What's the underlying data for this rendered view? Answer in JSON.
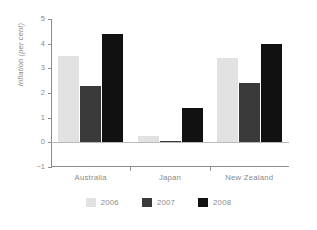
{
  "chart_data": {
    "type": "bar",
    "title": "",
    "subtitle": "",
    "xlabel": "",
    "ylabel": "Inflation (per cent)",
    "categories": [
      "Australia",
      "Japan",
      "New Zealand"
    ],
    "series": [
      {
        "name": "2006",
        "color": "#e2e2e2",
        "values": [
          3.5,
          0.25,
          3.4
        ]
      },
      {
        "name": "2007",
        "color": "#3a3a3a",
        "values": [
          2.3,
          0.06,
          2.4
        ]
      },
      {
        "name": "2008",
        "color": "#111111",
        "values": [
          4.4,
          1.4,
          4.0
        ]
      }
    ],
    "ylim": [
      -1,
      5
    ],
    "yticks": [
      5,
      4,
      3,
      2,
      1,
      0,
      -1
    ],
    "ytick_labels": [
      "5",
      "4",
      "3",
      "2",
      "1",
      "0",
      "−1"
    ],
    "grid": false,
    "legend_position": "bottom",
    "zero_line": true,
    "axis_color": "#8c8c8c",
    "text_color": "#8a8a8a"
  }
}
